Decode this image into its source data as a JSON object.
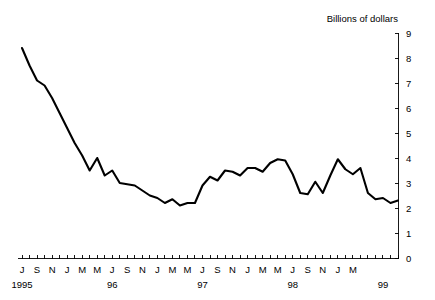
{
  "chart_data": {
    "type": "line",
    "title": "Billions of dollars",
    "xlabel": "",
    "ylabel": "Billions of dollars",
    "ylim": [
      0,
      9
    ],
    "ytick_values": [
      0,
      1,
      2,
      3,
      4,
      5,
      6,
      7,
      8,
      9
    ],
    "ytick_labels": [
      "0",
      "1",
      "2",
      "3",
      "4",
      "5",
      "6",
      "7",
      "8",
      "9"
    ],
    "y_axis_position": "right",
    "grid": false,
    "legend": null,
    "xtick_labels": [
      "J",
      "S",
      "N",
      "J",
      "M",
      "M",
      "J",
      "S",
      "N",
      "J",
      "M",
      "M",
      "J",
      "S",
      "N",
      "J",
      "M",
      "M",
      "J",
      "S",
      "N",
      "J",
      "M"
    ],
    "xtick_label_interval_months": 2,
    "year_labels": [
      "1995",
      "96",
      "97",
      "98",
      "99"
    ],
    "year_label_positions": [
      "1995-01",
      "1996-01",
      "1997-01",
      "1998-01",
      "1999-01"
    ],
    "x_start": "1995-01",
    "x_end": "1999-03",
    "x": [
      "1995-01",
      "1995-02",
      "1995-03",
      "1995-04",
      "1995-05",
      "1995-06",
      "1995-07",
      "1995-08",
      "1995-09",
      "1995-10",
      "1995-11",
      "1995-12",
      "1996-01",
      "1996-02",
      "1996-03",
      "1996-04",
      "1996-05",
      "1996-06",
      "1996-07",
      "1996-08",
      "1996-09",
      "1996-10",
      "1996-11",
      "1996-12",
      "1997-01",
      "1997-02",
      "1997-03",
      "1997-04",
      "1997-05",
      "1997-06",
      "1997-07",
      "1997-08",
      "1997-09",
      "1997-10",
      "1997-11",
      "1997-12",
      "1998-01",
      "1998-02",
      "1998-03",
      "1998-04",
      "1998-05",
      "1998-06",
      "1998-07",
      "1998-08",
      "1998-09",
      "1998-10",
      "1998-11",
      "1998-12",
      "1999-01",
      "1999-02",
      "1999-03"
    ],
    "values": [
      8.4,
      7.7,
      7.1,
      6.9,
      6.4,
      5.8,
      5.2,
      4.6,
      4.1,
      3.5,
      4.0,
      3.3,
      3.5,
      3.0,
      2.95,
      2.9,
      2.7,
      2.5,
      2.4,
      2.2,
      2.35,
      2.1,
      2.2,
      2.2,
      2.9,
      3.25,
      3.1,
      3.5,
      3.45,
      3.3,
      3.6,
      3.6,
      3.45,
      3.8,
      3.95,
      3.9,
      3.35,
      2.6,
      2.55,
      3.05,
      2.6,
      3.3,
      3.95,
      3.55,
      3.35,
      3.6,
      2.6,
      2.35,
      2.4,
      2.2,
      2.3
    ],
    "series": [
      {
        "name": "Billions of dollars",
        "color": "#000000",
        "values": [
          8.4,
          7.7,
          7.1,
          6.9,
          6.4,
          5.8,
          5.2,
          4.6,
          4.1,
          3.5,
          4.0,
          3.3,
          3.5,
          3.0,
          2.95,
          2.9,
          2.7,
          2.5,
          2.4,
          2.2,
          2.35,
          2.1,
          2.2,
          2.2,
          2.9,
          3.25,
          3.1,
          3.5,
          3.45,
          3.3,
          3.6,
          3.6,
          3.45,
          3.8,
          3.95,
          3.9,
          3.35,
          2.6,
          2.55,
          3.05,
          2.6,
          3.3,
          3.95,
          3.55,
          3.35,
          3.6,
          2.6,
          2.35,
          2.4,
          2.2,
          2.3
        ]
      }
    ]
  }
}
